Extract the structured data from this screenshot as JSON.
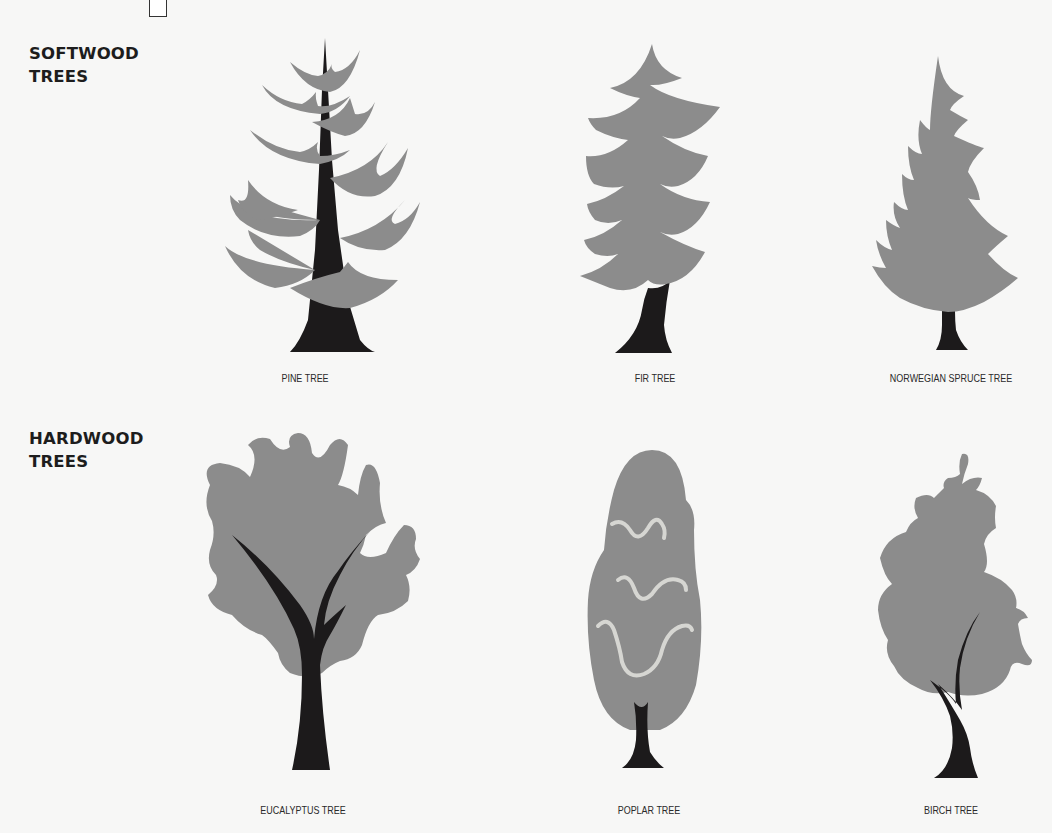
{
  "colors": {
    "foliage": "#8c8c8c",
    "trunk": "#1c1a1b",
    "highlight": "#d6d6d2",
    "background": "#f7f7f6",
    "text": "#1d1d1d"
  },
  "sections": [
    {
      "label": "SOFTWOOD\nTREES",
      "trees": [
        {
          "name": "PINE TREE",
          "icon": "pine-tree-icon"
        },
        {
          "name": "FIR TREE",
          "icon": "fir-tree-icon"
        },
        {
          "name": "NORWEGIAN SPRUCE TREE",
          "icon": "norwegian-spruce-tree-icon"
        }
      ]
    },
    {
      "label": "HARDWOOD\nTREES",
      "trees": [
        {
          "name": "EUCALYPTUS TREE",
          "icon": "eucalyptus-tree-icon"
        },
        {
          "name": "POPLAR TREE",
          "icon": "poplar-tree-icon"
        },
        {
          "name": "BIRCH TREE",
          "icon": "birch-tree-icon"
        }
      ]
    }
  ]
}
